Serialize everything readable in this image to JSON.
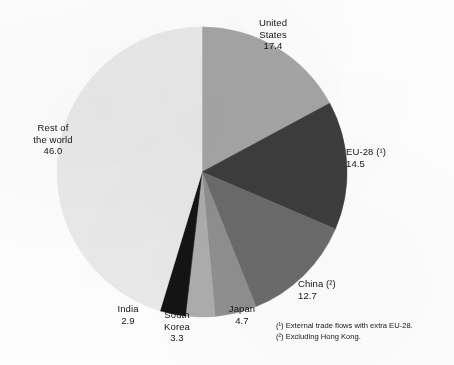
{
  "chart_data": {
    "type": "pie",
    "title": "",
    "subtitle": "",
    "xlabel": "",
    "ylabel": "",
    "units": "%",
    "legend_position": "none",
    "grid": false,
    "start_angle_deg": 0,
    "direction": "clockwise",
    "categories": [
      "United States",
      "EU-28 (¹)",
      "China (²)",
      "Japan",
      "South Korea",
      "India",
      "Rest of the world"
    ],
    "values": [
      17.4,
      14.5,
      12.7,
      4.7,
      3.3,
      2.9,
      46.0
    ],
    "colors": [
      "#a5a5a5",
      "#3d3d3d",
      "#6b6b6b",
      "#8f8f8f",
      "#adadad",
      "#141414",
      "#e9e9e9"
    ],
    "slices": [
      {
        "name": "United States",
        "label_line1": "United",
        "label_line2": "States",
        "value": "17.4",
        "value_num": 17.4,
        "color": "#a5a5a5"
      },
      {
        "name": "EU-28",
        "label_line1": "EU-28 (¹)",
        "label_line2": "",
        "value": "14.5",
        "value_num": 14.5,
        "color": "#3d3d3d"
      },
      {
        "name": "China",
        "label_line1": "China (²)",
        "label_line2": "",
        "value": "12.7",
        "value_num": 12.7,
        "color": "#6b6b6b"
      },
      {
        "name": "Japan",
        "label_line1": "Japan",
        "label_line2": "",
        "value": "4.7",
        "value_num": 4.7,
        "color": "#8f8f8f"
      },
      {
        "name": "South Korea",
        "label_line1": "South",
        "label_line2": "Korea",
        "value": "3.3",
        "value_num": 3.3,
        "color": "#adadad"
      },
      {
        "name": "India",
        "label_line1": "India",
        "label_line2": "",
        "value": "2.9",
        "value_num": 2.9,
        "color": "#141414"
      },
      {
        "name": "Rest of the world",
        "label_line1": "Rest of",
        "label_line2": "the world",
        "value": "46.0",
        "value_num": 46.0,
        "color": "#e9e9e9"
      }
    ]
  },
  "footnotes": {
    "note1": "(¹) External trade flows with extra EU-28.",
    "note2": "(²) Excluding Hong Kong."
  }
}
